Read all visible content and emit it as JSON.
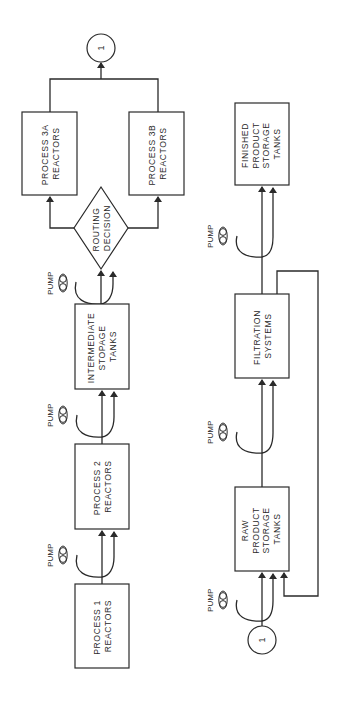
{
  "diagram": {
    "orientation": "rotated-90-ccw",
    "connector_label": "1",
    "pump_label": "PUMP",
    "upper_chain": {
      "process1": [
        "PROCESS 1",
        "REACTORS"
      ],
      "process2": [
        "PROCESS  2",
        "REACTORS"
      ],
      "intermediate": [
        "INTERMEDIATE",
        "STOPAGE",
        "TANKS"
      ],
      "routing": [
        "ROUTING",
        "DECISION"
      ],
      "process3a": [
        "PROCESS 3A",
        "REACTORS"
      ],
      "process3b": [
        "PROCESS 3B",
        "REACTORS"
      ]
    },
    "lower_chain": {
      "raw": [
        "RAW",
        "PRODUCT",
        "STORAGE",
        "TANKS"
      ],
      "filtration": [
        "FILTRATION",
        "SYSTEMS"
      ],
      "finished": [
        "FINISHED",
        "PRODUCT",
        "STORAGE",
        "TANKS"
      ]
    },
    "flow": [
      "PROCESS 1 REACTORS -> PUMP -> PROCESS 2 REACTORS",
      "PROCESS 2 REACTORS -> PUMP -> INTERMEDIATE STOPAGE TANKS",
      "INTERMEDIATE STOPAGE TANKS -> PUMP -> ROUTING DECISION",
      "ROUTING DECISION -> PROCESS 3A REACTORS",
      "ROUTING DECISION -> PROCESS 3B REACTORS",
      "PROCESS 3A / 3B REACTORS -> 1",
      "1 -> PUMP -> RAW PRODUCT STORAGE TANKS",
      "RAW PRODUCT STORAGE TANKS -> PUMP -> FILTRATION SYSTEMS",
      "FILTRATION SYSTEMS -> PUMP -> FINISHED PRODUCT STORAGE TANKS",
      "FILTRATION SYSTEMS -> recycle -> RAW PRODUCT STORAGE TANKS"
    ],
    "colors": {
      "ink": "#2a2a2a",
      "background": "#ffffff"
    }
  }
}
